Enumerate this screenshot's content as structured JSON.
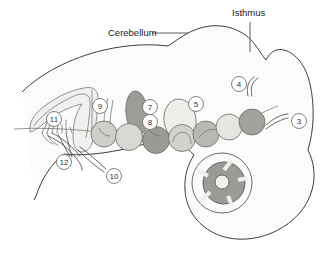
{
  "figure": {
    "title_labels": [
      {
        "id": "cerebellum",
        "text": "Cerebellum",
        "x": 108,
        "y": 36
      },
      {
        "id": "isthmus",
        "text": "Isthmus",
        "x": 246,
        "y": 16
      }
    ],
    "callouts": [
      {
        "id": "callout-3",
        "number": "3",
        "cx": 299,
        "cy": 121,
        "r": 7.5
      },
      {
        "id": "callout-4",
        "number": "4",
        "cx": 239,
        "cy": 84,
        "r": 7.5
      },
      {
        "id": "callout-5",
        "number": "5",
        "cx": 196,
        "cy": 104,
        "r": 7.5
      },
      {
        "id": "callout-7",
        "number": "7",
        "cx": 150,
        "cy": 107,
        "r": 7.5
      },
      {
        "id": "callout-8",
        "number": "8",
        "cx": 150,
        "cy": 122,
        "r": 7.5
      },
      {
        "id": "callout-9",
        "number": "9",
        "cx": 100,
        "cy": 106,
        "r": 7.5
      },
      {
        "id": "callout-10",
        "number": "10",
        "cx": 114,
        "cy": 176,
        "r": 7.5
      },
      {
        "id": "callout-11",
        "number": "11",
        "cx": 54,
        "cy": 119,
        "r": 7.5
      },
      {
        "id": "callout-12",
        "number": "12",
        "cx": 64,
        "cy": 162,
        "r": 7.5
      }
    ],
    "nuclei": [
      {
        "id": "nucleus-1",
        "cx": 104,
        "cy": 134,
        "rx": 13,
        "ry": 13,
        "fill": "#cfcfc9"
      },
      {
        "id": "nucleus-2",
        "cx": 129,
        "cy": 137,
        "rx": 13.5,
        "ry": 13.5,
        "fill": "#d9d9d3"
      },
      {
        "id": "nucleus-3",
        "cx": 156,
        "cy": 140,
        "rx": 13.5,
        "ry": 13.5,
        "fill": "#9a9a95"
      },
      {
        "id": "nucleus-4",
        "cx": 182,
        "cy": 138,
        "rx": 13.5,
        "ry": 13.5,
        "fill": "#d2d2cc"
      },
      {
        "id": "nucleus-5",
        "cx": 206,
        "cy": 134,
        "rx": 13,
        "ry": 13,
        "fill": "#b9b9b3"
      },
      {
        "id": "nucleus-6",
        "cx": 229,
        "cy": 127,
        "rx": 13,
        "ry": 13,
        "fill": "#e6e6e1"
      },
      {
        "id": "nucleus-7",
        "cx": 252,
        "cy": 122,
        "rx": 13,
        "ry": 13,
        "fill": "#a3a39d"
      }
    ],
    "upper_nuclei": [
      {
        "id": "upper-nucleus-dark",
        "cx": 137,
        "cy": 113,
        "rx": 11,
        "ry": 22,
        "rot": -6,
        "fill": "#9d9d98"
      },
      {
        "id": "upper-nucleus-pale",
        "cx": 180,
        "cy": 120,
        "rx": 16,
        "ry": 21,
        "rot": -8,
        "fill": "#eeeee9"
      }
    ],
    "cochlea": {
      "id": "cochlea-section",
      "cx": 224,
      "cy": 183,
      "outer_r": 21,
      "ring_fill": "#9b9b96",
      "center_fill": "#f2f2ee"
    },
    "colors": {
      "outline_stroke": "#3d3d3d",
      "body_fill": "#fbfbfb",
      "text": "#1a1a1a",
      "callout_stroke": "#6e6e6e",
      "nerve_stroke": "#555555"
    }
  }
}
